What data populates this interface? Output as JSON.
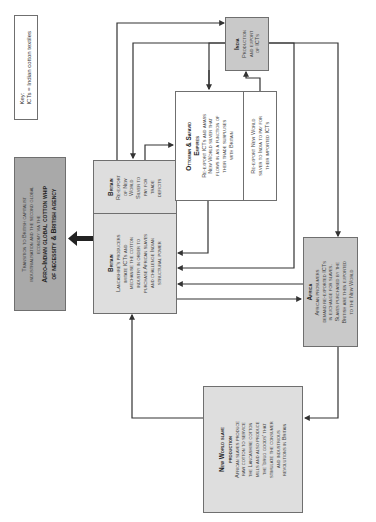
{
  "orientation": "rotated-90-ccw",
  "key": {
    "title": "Key:",
    "entry": "ICTs = Indian cotton textiles"
  },
  "transition": {
    "line1": "Transition to British capitalist",
    "line2": "industrialisation and the second global",
    "line3": "economy via the",
    "title1": "Afro-Indian global cotton whip",
    "title2": "of necessity & British agency"
  },
  "britain_main": {
    "title": "Britain",
    "lines": [
      "Lancashire's producers",
      "imitate ICTs and",
      "mechanise the cotton",
      "industry in order to",
      "purchase African slaves",
      "and challenge Indian",
      "structural power"
    ]
  },
  "britain_reexport": {
    "title": "Britain",
    "lines": [
      "Re-export",
      "of New",
      "World",
      "Silver to",
      "pay for",
      "trade",
      "deficits"
    ]
  },
  "ottoman": {
    "title1": "Ottoman & Safavid",
    "title2": "Empires",
    "lines": [
      "Re-export ICTs and amass",
      "New World silver that",
      "flows in as a function of",
      "their trade surpluses",
      "with Britain"
    ],
    "lower_lines": [
      "Re-export New World",
      "silver to India to pay for",
      "their imported ICTs"
    ]
  },
  "india": {
    "title": "India",
    "lines": [
      "Production",
      "and export",
      "of ICTs"
    ]
  },
  "africa": {
    "title": "Africa",
    "lines": [
      "African prosumers",
      "demand re-exported ICTs",
      "in exchange for slaves.",
      "Slaves purchased by the",
      "British are then exported",
      "to the New World"
    ]
  },
  "new_world": {
    "title1": "New World slave",
    "title2": "production",
    "lines": [
      "African slaves produce",
      "raw cotton to service",
      "the Lancashire cotton",
      "mills and also produce",
      "the 'drug goods' that",
      "stimulate the consumer",
      "and industrious",
      "revolutions in Britain"
    ]
  },
  "colors": {
    "box_gray": "#c9c9c9",
    "box_light": "#dedede",
    "box_dark": "#a9a9a9",
    "line": "#333333"
  }
}
